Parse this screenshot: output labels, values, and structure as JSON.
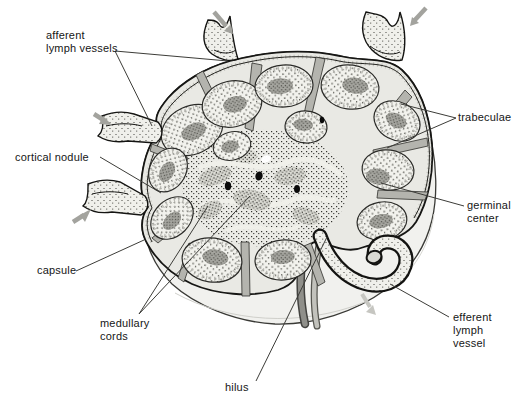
{
  "figure": {
    "labels": {
      "afferent_lymph_vessels": "afferent\nlymph vessels",
      "trabeculae": "trabeculae",
      "cortical_nodule": "cortical nodule",
      "germinal_center": "germinal\ncenter",
      "capsule": "capsule",
      "medullary_cords": "medullary\ncords",
      "efferent_lymph_vessel": "efferent\nlymph\nvessel",
      "hilus": "hilus"
    },
    "icons": {
      "flow_arrow": "lymph-flow-arrow"
    },
    "colors": {
      "background": "#ffffff",
      "ink": "#1a1a18",
      "label_text": "#161616",
      "leader_line": "#3c3c38",
      "node_surface": "#f1f1ee",
      "cut_face": "#e9e9e4",
      "trabecula_gray": "#b4b4ae",
      "germinal_center_gray": "#a6a6a0",
      "flow_arrow_gray": "#a3a39e",
      "efferent_arrow_gray": "#c6c6c1",
      "blood_vessel_dark": "#8f8f8a",
      "blood_vessel_light": "#c2c2bc"
    }
  }
}
